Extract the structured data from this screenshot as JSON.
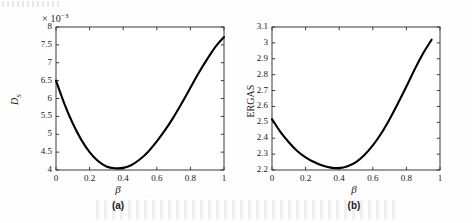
{
  "figure": {
    "panels": [
      {
        "caption": "(a)",
        "exponent_label": "× 10",
        "exponent_sup": "−3",
        "ylabel": "D",
        "ylabel_sub": "S",
        "xlabel": "β"
      },
      {
        "caption": "(b)",
        "ylabel": "ERGAS",
        "xlabel": "β"
      }
    ]
  },
  "chart_data": [
    {
      "type": "line",
      "title": "",
      "panel": "(a)",
      "xlabel": "β",
      "ylabel": "D_S",
      "y_scale_note": "× 10^-3",
      "xlim": [
        0,
        1
      ],
      "ylim": [
        4,
        8
      ],
      "xticks": [
        0,
        0.2,
        0.4,
        0.6,
        0.8,
        1
      ],
      "xticklabels": [
        "0",
        "0.2",
        "0.4",
        "0.6",
        "0.8",
        "1"
      ],
      "yticks": [
        4,
        4.5,
        5,
        5.5,
        6,
        6.5,
        7,
        7.5,
        8
      ],
      "yticklabels": [
        "4",
        "4.5",
        "5",
        "5.5",
        "6",
        "6.5",
        "7",
        "7.5",
        "8"
      ],
      "grid": false,
      "legend": null,
      "series": [
        {
          "name": "D_S vs beta",
          "color": "#000000",
          "x": [
            0,
            0.05,
            0.1,
            0.15,
            0.2,
            0.25,
            0.3,
            0.35,
            0.4,
            0.45,
            0.5,
            0.55,
            0.6,
            0.65,
            0.7,
            0.75,
            0.8,
            0.85,
            0.9,
            0.95,
            1
          ],
          "y": [
            6.5,
            5.85,
            5.3,
            4.85,
            4.5,
            4.25,
            4.1,
            4.05,
            4.06,
            4.14,
            4.3,
            4.52,
            4.8,
            5.12,
            5.48,
            5.88,
            6.3,
            6.72,
            7.1,
            7.45,
            7.72
          ]
        }
      ],
      "minimum": {
        "x": 0.35,
        "y": 4.05
      }
    },
    {
      "type": "line",
      "title": "",
      "panel": "(b)",
      "xlabel": "β",
      "ylabel": "ERGAS",
      "xlim": [
        0,
        1
      ],
      "ylim": [
        2.2,
        3.1
      ],
      "xticks": [
        0,
        0.2,
        0.4,
        0.6,
        0.8,
        1
      ],
      "xticklabels": [
        "0",
        "0.2",
        "0.4",
        "0.6",
        "0.8",
        "1"
      ],
      "yticks": [
        2.2,
        2.3,
        2.4,
        2.5,
        2.6,
        2.7,
        2.8,
        2.9,
        3.0,
        3.1
      ],
      "yticklabels": [
        "2.2",
        "2.3",
        "2.4",
        "2.5",
        "2.6",
        "2.7",
        "2.8",
        "2.9",
        "3",
        "3.1"
      ],
      "grid": false,
      "legend": null,
      "series": [
        {
          "name": "ERGAS vs beta",
          "color": "#000000",
          "x": [
            0,
            0.05,
            0.1,
            0.15,
            0.2,
            0.25,
            0.3,
            0.35,
            0.4,
            0.45,
            0.5,
            0.55,
            0.6,
            0.65,
            0.7,
            0.75,
            0.8,
            0.85,
            0.9,
            0.95
          ],
          "y": [
            2.52,
            2.44,
            2.375,
            2.32,
            2.28,
            2.25,
            2.228,
            2.215,
            2.212,
            2.224,
            2.25,
            2.295,
            2.355,
            2.43,
            2.52,
            2.62,
            2.725,
            2.835,
            2.935,
            3.02
          ]
        }
      ],
      "minimum": {
        "x": 0.4,
        "y": 2.212
      }
    }
  ]
}
